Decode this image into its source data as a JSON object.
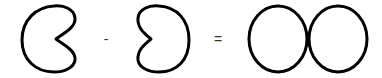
{
  "diagram": {
    "terms": [
      {
        "type": "shape",
        "name": "kidney-left-opening",
        "label": ""
      },
      {
        "type": "operator",
        "symbol": "-"
      },
      {
        "type": "shape",
        "name": "kidney-right-opening",
        "label": ""
      },
      {
        "type": "operator",
        "symbol": "="
      },
      {
        "type": "shape",
        "name": "double-ellipse",
        "label": ""
      }
    ],
    "operators": {
      "minus": "-",
      "equals": "="
    },
    "colors": {
      "stroke": "#000000",
      "background": "#ffffff",
      "operator": "#333333"
    }
  }
}
